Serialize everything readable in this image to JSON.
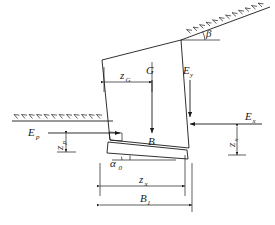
{
  "figure": {
    "type": "engineering-diagram",
    "background_color": "#ffffff",
    "line_color": "#1a1a1a"
  },
  "labels": {
    "weight_force": "G",
    "wall_base_label": "B",
    "earth_pressure_vertical": "E",
    "earth_pressure_vertical_sub": "y",
    "earth_pressure_horizontal": "E",
    "earth_pressure_horizontal_sub": "x",
    "passive_pressure": "E",
    "passive_pressure_sub": "p",
    "centroid_distance": "z",
    "centroid_distance_sub": "G",
    "horizontal_arm": "z",
    "horizontal_arm_sub": "x",
    "base_width": "B",
    "base_width_sub": "1",
    "base_inclination": "α",
    "base_inclination_sub": "0",
    "backfill_slope_angle": "β",
    "passive_arm": "z",
    "passive_arm_sub": "p",
    "horizontal_pressure_arm": "z",
    "horizontal_pressure_arm_sub": "x"
  },
  "elements": {
    "ground_surface_left": "ground-line-left",
    "ground_surface_right": "backfill-slope-line",
    "wall_body": "gravity-retaining-wall",
    "wall_base_wedge": "wall-base-wedge",
    "weight_arrow": "weight-force-arrow",
    "ey_arrow": "vertical-earth-pressure-arrow",
    "ex_arrow": "horizontal-earth-pressure-arrow",
    "ep_arrow": "passive-earth-pressure-arrow",
    "dim_zg": "dimension-zg",
    "dim_zx": "dimension-zx",
    "dim_b1": "dimension-b1",
    "dim_zp_vertical": "dimension-zp-vertical",
    "dim_zx_vertical": "dimension-zx-vertical",
    "angle_alpha0": "angle-alpha0-marker",
    "angle_beta": "angle-beta-marker"
  }
}
